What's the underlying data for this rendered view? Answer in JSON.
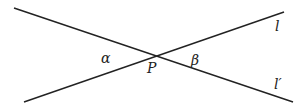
{
  "diagram": {
    "lines": [
      {
        "name": "l",
        "label": "l",
        "x1": 24,
        "y1": 102,
        "x2": 284,
        "y2": 12
      },
      {
        "name": "l-prime",
        "label": "l′",
        "x1": 14,
        "y1": 8,
        "x2": 293,
        "y2": 102
      }
    ],
    "point": {
      "label": "P"
    },
    "angles": {
      "alpha": "α",
      "beta": "β"
    },
    "stroke_color": "#222222"
  }
}
